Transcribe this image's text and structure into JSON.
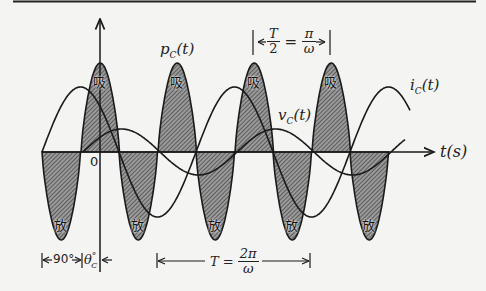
{
  "diagram": {
    "axis": {
      "x_label": "t(s)",
      "origin_label": "0"
    },
    "curves": {
      "power": {
        "label_base": "p",
        "label_sub": "C",
        "label_arg": "(t)"
      },
      "voltage": {
        "label_base": "v",
        "label_sub": "C",
        "label_arg": "(t)"
      },
      "current": {
        "label_base": "i",
        "label_sub": "C",
        "label_arg": "(t)"
      }
    },
    "lobe_labels": {
      "absorb": "吸",
      "release": "放"
    },
    "annotations": {
      "half_period": {
        "lhs_num": "T",
        "lhs_den": "2",
        "eq": "=",
        "rhs_num": "π",
        "rhs_den": "ω"
      },
      "period": {
        "lhs": "T =",
        "rhs_num": "2π",
        "rhs_den": "ω"
      },
      "phase_90": "90°",
      "theta_c": "θ",
      "theta_c_sub": "C",
      "theta_c_deg": "°"
    },
    "colors": {
      "line": "#1a1a1a",
      "hatch_fill": "#8a8a8a",
      "background": "#f4f4f2"
    }
  }
}
